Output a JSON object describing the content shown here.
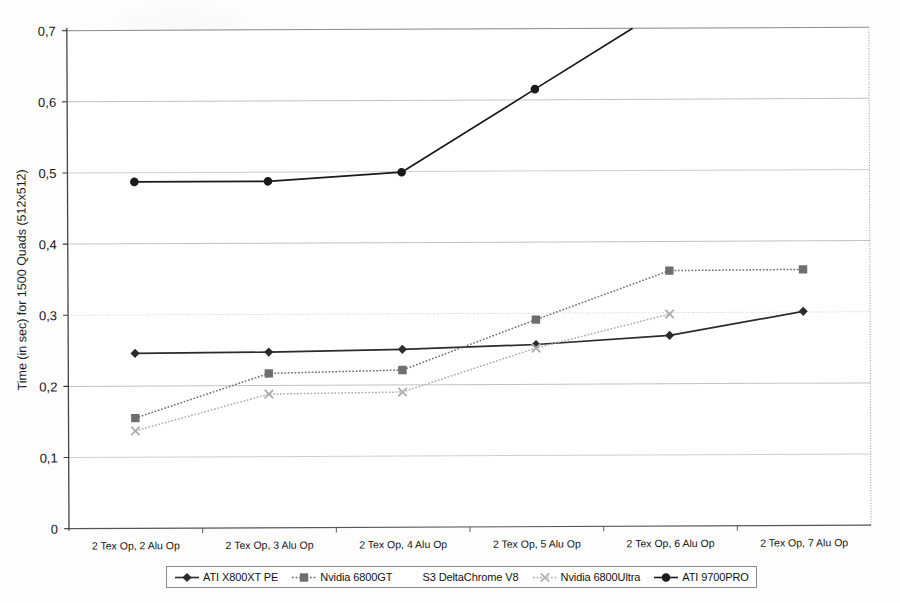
{
  "chart_data": {
    "type": "line",
    "title": "",
    "xlabel": "",
    "ylabel": "Time (in sec) for 1500 Quads (512x512)",
    "ylim": [
      0,
      0.7
    ],
    "ytick_labels": [
      "0",
      "0,1",
      "0,2",
      "0,3",
      "0,4",
      "0,5",
      "0,6",
      "0,7"
    ],
    "ytick_values": [
      0,
      0.1,
      0.2,
      0.3,
      0.4,
      0.5,
      0.6,
      0.7
    ],
    "grid": true,
    "legend_position": "bottom",
    "categories": [
      "2 Tex Op, 2 Alu Op",
      "2 Tex Op, 3 Alu Op",
      "2 Tex Op, 4 Alu Op",
      "2 Tex Op, 5 Alu Op",
      "2 Tex Op, 6 Alu Op",
      "2 Tex Op, 7 Alu Op"
    ],
    "series": [
      {
        "name": "ATI X800XT PE",
        "marker": "diamond",
        "color": "#2b2b2b",
        "line": "solid",
        "values": [
          0.246,
          0.247,
          0.25,
          0.256,
          0.268,
          0.301
        ]
      },
      {
        "name": "Nvidia 6800GT",
        "marker": "square",
        "color": "#6e6e6e",
        "line": "dotted",
        "values": [
          0.155,
          0.217,
          0.221,
          0.291,
          0.359,
          0.36
        ]
      },
      {
        "name": "S3 DeltaChrome V8",
        "marker": "triangle",
        "color": "#b5b5b5",
        "line": "none",
        "values": [
          null,
          null,
          null,
          null,
          null,
          null
        ]
      },
      {
        "name": "Nvidia 6800Ultra",
        "marker": "x",
        "color": "#adadad",
        "line": "dotted",
        "values": [
          0.137,
          0.188,
          0.19,
          0.251,
          0.298,
          null
        ]
      },
      {
        "name": "ATI 9700PRO",
        "marker": "circle",
        "color": "#1a1a1a",
        "line": "solid",
        "values": [
          0.487,
          0.487,
          0.499,
          0.615,
          null,
          null
        ]
      }
    ]
  },
  "legend": {
    "items": [
      {
        "label": "ATI X800XT PE",
        "marker": "diamond",
        "color": "#2b2b2b",
        "line": "solid"
      },
      {
        "label": "Nvidia 6800GT",
        "marker": "square",
        "color": "#6e6e6e",
        "line": "dotted"
      },
      {
        "label": "S3 DeltaChrome V8",
        "marker": "none",
        "color": "#c9c9c9",
        "line": "none"
      },
      {
        "label": "Nvidia 6800Ultra",
        "marker": "x",
        "color": "#b0b0b0",
        "line": "dotted"
      },
      {
        "label": "ATI 9700PRO",
        "marker": "circle",
        "color": "#1a1a1a",
        "line": "solid"
      }
    ]
  }
}
